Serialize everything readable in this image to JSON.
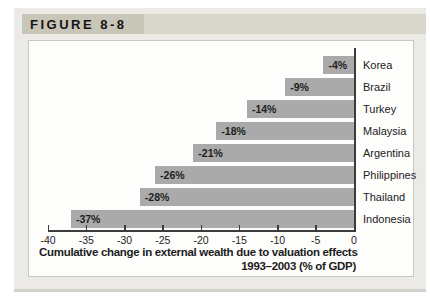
{
  "figure": {
    "label": "FIGURE 8-8"
  },
  "chart_data": {
    "type": "bar",
    "orientation": "horizontal",
    "categories": [
      "Korea",
      "Brazil",
      "Turkey",
      "Malaysia",
      "Argentina",
      "Philippines",
      "Thailand",
      "Indonesia"
    ],
    "values": [
      -4,
      -9,
      -14,
      -18,
      -21,
      -26,
      -28,
      -37
    ],
    "bar_labels": [
      "-4%",
      "-9%",
      "-14%",
      "-18%",
      "-21%",
      "-26%",
      "-28%",
      "-37%"
    ],
    "title_line1": "Cumulative change in external wealth due to valuation effects",
    "title_line2": "1993–2003 (% of GDP)",
    "xlim": [
      -40,
      0
    ],
    "x_ticks": [
      -40,
      -35,
      -30,
      -25,
      -20,
      -15,
      -10,
      -5,
      0
    ],
    "x_tick_labels": [
      "-40",
      "-35",
      "-30",
      "-25",
      "-20",
      "-15",
      "-10",
      "-5",
      "0"
    ],
    "grid": false,
    "legend": null,
    "bar_color": "#aaaaaa",
    "axis_color": "#3c3c3c"
  },
  "colors": {
    "frame_background": "#ebeae6",
    "header_label_box": "#c8c6b8",
    "header_strip": "#d9d7cb",
    "panel_background": "#fdfdfb",
    "text": "#1c1c1c"
  }
}
